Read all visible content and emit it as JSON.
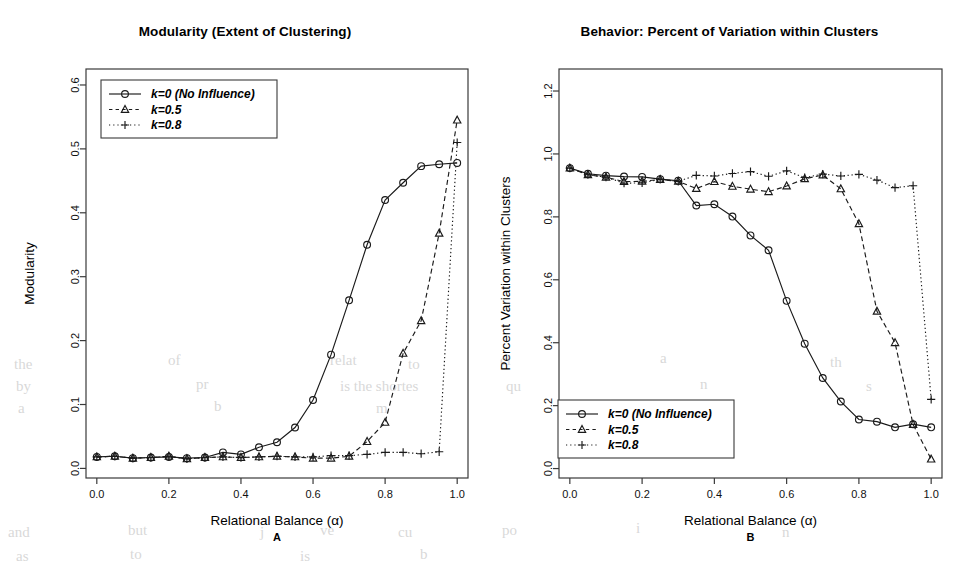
{
  "figure": {
    "background_color": "#ffffff",
    "ink_color": "#1a1a1a",
    "panels": [
      {
        "id": "A",
        "letter": "A",
        "title": "Modularity (Extent of Clustering)",
        "xlabel": "Relational Balance (α)",
        "ylabel": "Modularity"
      },
      {
        "id": "B",
        "letter": "B",
        "title": "Behavior: Percent of Variation within Clusters",
        "xlabel": "Relational Balance (α)",
        "ylabel": "Percent Variation within Clusters"
      }
    ]
  },
  "chart_data": [
    {
      "type": "line",
      "panel": "A",
      "title": "Modularity (Extent of Clustering)",
      "xlabel": "Relational Balance (α)",
      "ylabel": "Modularity",
      "xlim": [
        -0.03,
        1.03
      ],
      "ylim": [
        -0.015,
        0.625
      ],
      "xticks": [
        0.0,
        0.2,
        0.4,
        0.6,
        0.8,
        1.0
      ],
      "xticklabels": [
        "0.0",
        "0.2",
        "0.4",
        "0.6",
        "0.8",
        "1.0"
      ],
      "yticks": [
        0.0,
        0.1,
        0.2,
        0.3,
        0.4,
        0.5,
        0.6
      ],
      "yticklabels": [
        "0.0",
        "0.1",
        "0.2",
        "0.3",
        "0.4",
        "0.5",
        "0.6"
      ],
      "grid": false,
      "legend_position": "top-left",
      "x": [
        0.0,
        0.05,
        0.1,
        0.15,
        0.2,
        0.25,
        0.3,
        0.35,
        0.4,
        0.45,
        0.5,
        0.55,
        0.6,
        0.65,
        0.7,
        0.75,
        0.8,
        0.85,
        0.9,
        0.95,
        1.0
      ],
      "series": [
        {
          "name": "k=0 (No Influence)",
          "marker": "circle",
          "linestyle": "solid",
          "values": [
            0.018,
            0.019,
            0.016,
            0.017,
            0.018,
            0.016,
            0.017,
            0.025,
            0.022,
            0.033,
            0.041,
            0.064,
            0.107,
            0.178,
            0.263,
            0.35,
            0.42,
            0.447,
            0.473,
            0.476,
            0.478
          ]
        },
        {
          "name": "k=0.5",
          "marker": "triangle",
          "linestyle": "dashed",
          "values": [
            0.018,
            0.019,
            0.016,
            0.017,
            0.019,
            0.015,
            0.017,
            0.018,
            0.017,
            0.018,
            0.019,
            0.018,
            0.016,
            0.016,
            0.019,
            0.042,
            0.072,
            0.18,
            0.231,
            0.368,
            0.545
          ]
        },
        {
          "name": "k=0.8",
          "marker": "plus",
          "linestyle": "dotted",
          "values": [
            0.018,
            0.019,
            0.016,
            0.017,
            0.019,
            0.015,
            0.017,
            0.018,
            0.017,
            0.018,
            0.019,
            0.018,
            0.018,
            0.02,
            0.02,
            0.022,
            0.025,
            0.025,
            0.023,
            0.026,
            0.51
          ]
        }
      ]
    },
    {
      "type": "line",
      "panel": "B",
      "title": "Behavior: Percent of Variation within Clusters",
      "xlabel": "Relational Balance (α)",
      "ylabel": "Percent Variation within Clusters",
      "xlim": [
        -0.03,
        1.03
      ],
      "ylim": [
        -0.03,
        1.27
      ],
      "xticks": [
        0.0,
        0.2,
        0.4,
        0.6,
        0.8,
        1.0
      ],
      "xticklabels": [
        "0.0",
        "0.2",
        "0.4",
        "0.6",
        "0.8",
        "1.0"
      ],
      "yticks": [
        0.0,
        0.2,
        0.4,
        0.6,
        0.8,
        1.0,
        1.2
      ],
      "yticklabels": [
        "0.0",
        "0.2",
        "0.4",
        "0.6",
        "0.8",
        "1.0",
        "1.2"
      ],
      "grid": false,
      "legend_position": "bottom-left",
      "x": [
        0.0,
        0.05,
        0.1,
        0.15,
        0.2,
        0.25,
        0.3,
        0.35,
        0.4,
        0.45,
        0.5,
        0.55,
        0.6,
        0.65,
        0.7,
        0.75,
        0.8,
        0.85,
        0.9,
        0.95,
        1.0
      ],
      "series": [
        {
          "name": "k=0 (No Influence)",
          "marker": "circle",
          "linestyle": "solid",
          "values": [
            0.955,
            0.937,
            0.931,
            0.928,
            0.927,
            0.92,
            0.915,
            0.836,
            0.84,
            0.801,
            0.741,
            0.694,
            0.533,
            0.397,
            0.288,
            0.213,
            0.156,
            0.149,
            0.131,
            0.141,
            0.131
          ]
        },
        {
          "name": "k=0.5",
          "marker": "triangle",
          "linestyle": "dashed",
          "values": [
            0.955,
            0.934,
            0.926,
            0.912,
            0.913,
            0.919,
            0.913,
            0.89,
            0.912,
            0.897,
            0.888,
            0.88,
            0.898,
            0.921,
            0.933,
            0.889,
            0.778,
            0.5,
            0.4,
            0.14,
            0.03
          ]
        },
        {
          "name": "k=0.8",
          "marker": "plus",
          "linestyle": "dotted",
          "values": [
            0.955,
            0.934,
            0.926,
            0.907,
            0.908,
            0.919,
            0.913,
            0.932,
            0.93,
            0.938,
            0.944,
            0.929,
            0.946,
            0.925,
            0.936,
            0.93,
            0.935,
            0.917,
            0.893,
            0.899,
            0.22
          ]
        }
      ]
    }
  ],
  "legend": {
    "entries": [
      {
        "label": "k=0 (No Influence)",
        "marker": "circle",
        "linestyle": "solid"
      },
      {
        "label": "k=0.5",
        "marker": "triangle",
        "linestyle": "dashed"
      },
      {
        "label": "k=0.8",
        "marker": "plus",
        "linestyle": "dotted"
      }
    ]
  },
  "background_text": [
    {
      "text": "the",
      "x": 14,
      "y": 356,
      "size": 15
    },
    {
      "text": "of",
      "x": 168,
      "y": 352,
      "size": 15
    },
    {
      "text": "relat",
      "x": 330,
      "y": 352,
      "size": 15
    },
    {
      "text": "to",
      "x": 408,
      "y": 356,
      "size": 15
    },
    {
      "text": "by",
      "x": 16,
      "y": 378,
      "size": 15
    },
    {
      "text": "pr",
      "x": 196,
      "y": 376,
      "size": 15
    },
    {
      "text": "is the shortes",
      "x": 340,
      "y": 378,
      "size": 15
    },
    {
      "text": "a",
      "x": 18,
      "y": 400,
      "size": 15
    },
    {
      "text": "b",
      "x": 214,
      "y": 398,
      "size": 15
    },
    {
      "text": "m",
      "x": 376,
      "y": 400,
      "size": 15
    },
    {
      "text": "and",
      "x": 8,
      "y": 524,
      "size": 15
    },
    {
      "text": "but",
      "x": 128,
      "y": 522,
      "size": 15
    },
    {
      "text": "j",
      "x": 260,
      "y": 524,
      "size": 15
    },
    {
      "text": "ve",
      "x": 320,
      "y": 522,
      "size": 15
    },
    {
      "text": "cu",
      "x": 398,
      "y": 524,
      "size": 15
    },
    {
      "text": "as",
      "x": 16,
      "y": 548,
      "size": 15
    },
    {
      "text": "to",
      "x": 130,
      "y": 546,
      "size": 15
    },
    {
      "text": "is",
      "x": 300,
      "y": 548,
      "size": 15
    },
    {
      "text": "b",
      "x": 420,
      "y": 546,
      "size": 15
    },
    {
      "text": "cl",
      "x": 500,
      "y": 352,
      "size": 15
    },
    {
      "text": "a",
      "x": 660,
      "y": 350,
      "size": 15
    },
    {
      "text": "th",
      "x": 830,
      "y": 354,
      "size": 15
    },
    {
      "text": "qu",
      "x": 506,
      "y": 378,
      "size": 15
    },
    {
      "text": "n",
      "x": 700,
      "y": 376,
      "size": 15
    },
    {
      "text": "s",
      "x": 866,
      "y": 378,
      "size": 15
    },
    {
      "text": "po",
      "x": 502,
      "y": 522,
      "size": 15
    },
    {
      "text": "i",
      "x": 636,
      "y": 520,
      "size": 15
    },
    {
      "text": "n",
      "x": 782,
      "y": 524,
      "size": 15
    }
  ]
}
